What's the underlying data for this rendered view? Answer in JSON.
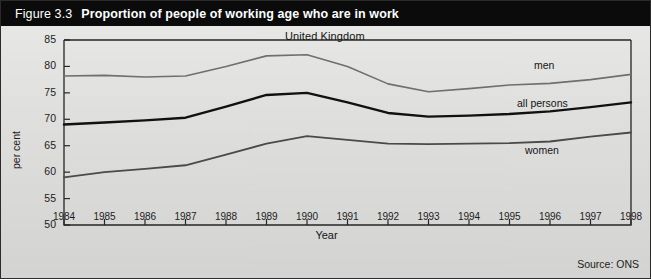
{
  "header": {
    "figure_number": "Figure 3.3",
    "title": "Proportion of people of working age who are in work",
    "bar_color": "#0b0b0b",
    "text_color": "#ffffff"
  },
  "footer": {
    "source": "Source: ONS"
  },
  "chart_data": {
    "type": "line",
    "title": "Proportion of people of working age who are in work",
    "subtitle": "United Kingdom",
    "xlabel": "Year",
    "ylabel": "per cent",
    "ylim": [
      50,
      85
    ],
    "ytick_step": 5,
    "yticks": [
      50,
      55,
      60,
      65,
      70,
      75,
      80,
      85
    ],
    "grid": false,
    "legend_position": "inline-right",
    "categories": [
      1984,
      1985,
      1986,
      1987,
      1988,
      1989,
      1990,
      1991,
      1992,
      1993,
      1994,
      1995,
      1996,
      1997,
      1998
    ],
    "xtick_labels": [
      "1984",
      "1985",
      "1986",
      "1987",
      "1988",
      "1989",
      "1990",
      "1991",
      "1992",
      "1993",
      "1994",
      "1995",
      "1996",
      "1997",
      "1998"
    ],
    "series": [
      {
        "name": "men",
        "color": "#6f6f6f",
        "width": 1.6,
        "values": [
          78.2,
          78.3,
          78.0,
          78.2,
          80.0,
          82.0,
          82.2,
          80.0,
          76.7,
          75.2,
          75.8,
          76.5,
          76.8,
          77.5,
          78.5
        ]
      },
      {
        "name": "all persons",
        "color": "#111111",
        "width": 2.4,
        "values": [
          69.0,
          69.4,
          69.8,
          70.3,
          72.4,
          74.6,
          75.0,
          73.2,
          71.2,
          70.5,
          70.7,
          71.0,
          71.5,
          72.3,
          73.2
        ]
      },
      {
        "name": "women",
        "color": "#4a4a4a",
        "width": 1.8,
        "values": [
          59.0,
          60.0,
          60.6,
          61.3,
          63.3,
          65.4,
          66.8,
          66.1,
          65.4,
          65.3,
          65.4,
          65.5,
          65.8,
          66.7,
          67.5
        ]
      }
    ]
  },
  "axis": {
    "line_color": "#262626"
  }
}
